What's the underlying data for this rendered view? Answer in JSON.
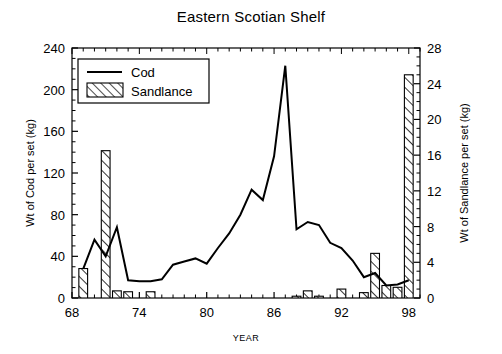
{
  "chart_data": {
    "type": "bar",
    "title": "Eastern Scotian Shelf",
    "xlabel": "YEAR",
    "ylabel": "Wt of Cod per set (kg)",
    "y2label": "Wt of Sandlance per set (kg)",
    "xlim": [
      68,
      99
    ],
    "ylim": [
      0,
      240
    ],
    "y2lim": [
      0,
      28
    ],
    "grid": false,
    "legend_position": "top-left",
    "xticks": [
      "68",
      "74",
      "80",
      "86",
      "92",
      "98"
    ],
    "xtick_values": [
      68,
      74,
      80,
      86,
      92,
      98
    ],
    "yticks": [
      "0",
      "40",
      "80",
      "120",
      "160",
      "200",
      "240"
    ],
    "ytick_values": [
      0,
      40,
      80,
      120,
      160,
      200,
      240
    ],
    "y2ticks": [
      "0",
      "4",
      "8",
      "12",
      "16",
      "20",
      "24",
      "28"
    ],
    "y2tick_values": [
      0,
      4,
      8,
      12,
      16,
      20,
      24,
      28
    ],
    "x": [
      69,
      70,
      71,
      72,
      73,
      74,
      75,
      76,
      77,
      78,
      79,
      80,
      81,
      82,
      83,
      84,
      85,
      86,
      87,
      88,
      89,
      90,
      91,
      92,
      93,
      94,
      95,
      96,
      97,
      98
    ],
    "series": [
      {
        "name": "Cod",
        "type": "line",
        "axis": "left",
        "values": [
          28,
          56,
          40,
          68,
          17,
          16,
          16,
          18,
          32,
          35,
          38,
          33,
          48,
          62,
          80,
          104,
          94,
          136,
          223,
          66,
          73,
          70,
          53,
          48,
          36,
          20,
          24,
          12,
          13,
          17
        ]
      },
      {
        "name": "Sandlance",
        "type": "bar",
        "axis": "right",
        "values": [
          3.3,
          0,
          16.5,
          0.8,
          0.7,
          0,
          0.7,
          0,
          0,
          0,
          0,
          0,
          0,
          0,
          0,
          0,
          0,
          0,
          0,
          0.2,
          0.8,
          0.2,
          0,
          1.0,
          0,
          0.6,
          5.0,
          1.4,
          1.2,
          25.0
        ]
      }
    ]
  },
  "legend": {
    "entries": [
      {
        "label": "Cod",
        "marker": "line"
      },
      {
        "label": "Sandlance",
        "marker": "hatched-bar"
      }
    ]
  },
  "colors": {
    "foreground": "#000000",
    "background": "#ffffff",
    "bar_fill": "#ffffff",
    "bar_hatch": "#000000",
    "line": "#000000"
  }
}
